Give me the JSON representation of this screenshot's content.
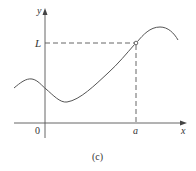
{
  "figure": {
    "caption": "(c)",
    "axes": {
      "x_label": "x",
      "y_label": "y",
      "origin_label": "0"
    },
    "markers": {
      "x_marker_label": "a",
      "y_marker_label": "L"
    },
    "point": {
      "style": "hollow-circle",
      "description": "open circle at (a, L) — value not attained"
    },
    "curve": {
      "description": "smooth curve with local max left of y-axis, local min right of y-axis, rising through hole at (a, L), peak beyond a, then decreasing"
    },
    "colors": {
      "line": "#555555",
      "text": "#333333",
      "background": "#ffffff"
    }
  }
}
